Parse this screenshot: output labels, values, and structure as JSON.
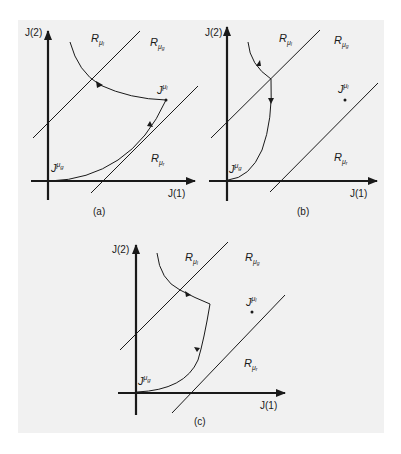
{
  "figure": {
    "background": "#f1f1f1",
    "ink": "#1a1a1a",
    "panels": [
      {
        "id": "a",
        "caption": "(a)",
        "x_axis_label": "J(1)",
        "y_axis_label": "J(2)",
        "regions": {
          "R_l": {
            "base": "R",
            "sub": "μ",
            "subsub": "l"
          },
          "R_g": {
            "base": "R",
            "sub": "μ",
            "subsub": "g"
          },
          "R_r": {
            "base": "R",
            "sub": "μ",
            "subsub": "r"
          }
        },
        "points": {
          "J_l": {
            "base": "J",
            "sup": "μ",
            "supsub": "l"
          },
          "J_g": {
            "base": "J",
            "sup": "μ",
            "supsub": "g"
          }
        },
        "description": "Trajectory enters R_μl, crosses into R_μg toward J^μl, then descends along boundary of R_μr to J^μg"
      },
      {
        "id": "b",
        "caption": "(b)",
        "x_axis_label": "J(1)",
        "y_axis_label": "J(2)",
        "regions": {
          "R_l": {
            "base": "R",
            "sub": "μ",
            "subsub": "l"
          },
          "R_g": {
            "base": "R",
            "sub": "μ",
            "subsub": "g"
          },
          "R_r": {
            "base": "R",
            "sub": "μ",
            "subsub": "r"
          }
        },
        "points": {
          "J_l": {
            "base": "J",
            "sup": "μ",
            "supsub": "l"
          },
          "J_g": {
            "base": "J",
            "sup": "μ",
            "supsub": "g"
          }
        },
        "description": "Trajectory hits the R_μl/R_μg boundary and slides down directly to J^μg"
      },
      {
        "id": "c",
        "caption": "(c)",
        "x_axis_label": "J(1)",
        "y_axis_label": "J(2)",
        "regions": {
          "R_l": {
            "base": "R",
            "sub": "μ",
            "subsub": "l"
          },
          "R_g": {
            "base": "R",
            "sub": "μ",
            "subsub": "g"
          },
          "R_r": {
            "base": "R",
            "sub": "μ",
            "subsub": "r"
          }
        },
        "points": {
          "J_l": {
            "base": "J",
            "sup": "μ",
            "supsub": "l"
          },
          "J_g": {
            "base": "J",
            "sup": "μ",
            "supsub": "g"
          }
        },
        "description": "Trajectory crosses into R_μg, moves partway toward J^μl, then turns and descends to J^μg"
      }
    ]
  }
}
